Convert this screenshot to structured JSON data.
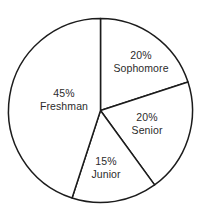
{
  "chart_data": {
    "type": "pie",
    "title": "",
    "subtitle": "",
    "xlabel": "",
    "ylabel": "",
    "grid": false,
    "legend": "none",
    "units": "percent",
    "start_angle_deg": 0,
    "direction": "clockwise",
    "geometry": {
      "center_x": 100.5,
      "center_y": 110.5,
      "radius": 92
    },
    "style": {
      "slice_fill": "#ffffff",
      "outline_color": "#1c1c1c",
      "outline_width": 1.5,
      "label_color": "#2b2b2b",
      "background": "#ffffff"
    },
    "categories": [
      "Sophomore",
      "Senior",
      "Junior",
      "Freshman"
    ],
    "values": [
      20,
      20,
      15,
      45
    ],
    "slices": [
      {
        "name": "Sophomore",
        "value": 20,
        "percent_label": "20%",
        "label_line1": "20%",
        "label_line2": "Sophomore",
        "start_deg": 0,
        "end_deg": 72,
        "label_x": 141,
        "label_y": 61
      },
      {
        "name": "Senior",
        "value": 20,
        "percent_label": "20%",
        "label_line1": "20%",
        "label_line2": "Senior",
        "start_deg": 72,
        "end_deg": 144,
        "label_x": 147,
        "label_y": 123
      },
      {
        "name": "Junior",
        "value": 15,
        "percent_label": "15%",
        "label_line1": "15%",
        "label_line2": "Junior",
        "start_deg": 144,
        "end_deg": 198,
        "label_x": 106,
        "label_y": 167
      },
      {
        "name": "Freshman",
        "value": 45,
        "percent_label": "45%",
        "label_line1": "45%",
        "label_line2": "Freshman",
        "start_deg": 198,
        "end_deg": 360,
        "label_x": 64,
        "label_y": 99
      }
    ]
  }
}
